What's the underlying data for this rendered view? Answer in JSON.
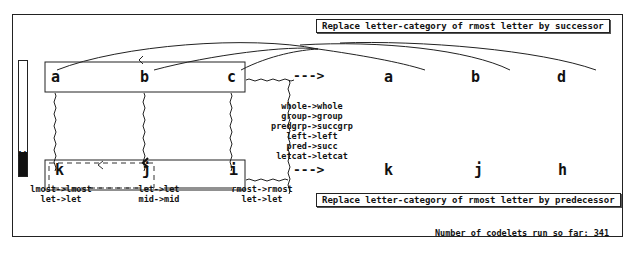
{
  "top_rule": "Replace letter-category of rmost letter by successor",
  "bottom_rule": "Replace letter-category of rmost letter by predecessor",
  "status": "Number of codelets run so far: 341",
  "temperature": {
    "value": "14",
    "fill_percent": 20
  },
  "initial_string": [
    "a",
    "b",
    "c"
  ],
  "modified_string": [
    "a",
    "b",
    "d"
  ],
  "target_string": [
    "k",
    "j",
    "i"
  ],
  "answer_string": [
    "k",
    "j",
    "h"
  ],
  "arrow": "--->",
  "concept_mappings": [
    "whole->whole",
    "group->group",
    "predgrp->succgrp",
    "left->left",
    "pred->succ",
    "letcat->letcat"
  ],
  "letter_mappings": {
    "k": [
      "lmost->lmost",
      "let->let"
    ],
    "j": [
      "let->let",
      "mid->mid"
    ],
    "i": [
      "rmost->rmost",
      "let->let"
    ]
  },
  "colors": {
    "ink": "#111111",
    "background": "#ffffff"
  }
}
